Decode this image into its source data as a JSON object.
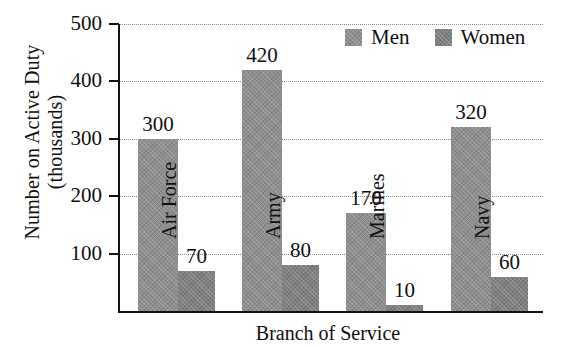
{
  "chart_data": {
    "type": "bar",
    "title": "",
    "xlabel": "Branch of Service",
    "ylabel": "Number on Active Duty (thousands)",
    "ylabel_line1": "Number on Active Duty",
    "ylabel_line2": "(thousands)",
    "categories": [
      "Air Force",
      "Army",
      "Marines",
      "Navy"
    ],
    "series": [
      {
        "name": "Men",
        "values": [
          300,
          420,
          170,
          320
        ],
        "color": "#8e8e8e"
      },
      {
        "name": "Women",
        "values": [
          70,
          80,
          10,
          60
        ],
        "color": "#7f7f7f"
      }
    ],
    "ylim": [
      0,
      500
    ],
    "yticks": [
      100,
      200,
      300,
      400,
      500
    ],
    "ytick_labels": [
      "100",
      "200",
      "300",
      "400",
      "500"
    ],
    "grid": "horizontal-dotted",
    "legend_position": "top-right",
    "bar_labels": {
      "men": [
        "300",
        "420",
        "170",
        "320"
      ],
      "women": [
        "70",
        "80",
        "10",
        "60"
      ]
    }
  },
  "legend": {
    "items": [
      {
        "label": "Men"
      },
      {
        "label": "Women"
      }
    ]
  }
}
